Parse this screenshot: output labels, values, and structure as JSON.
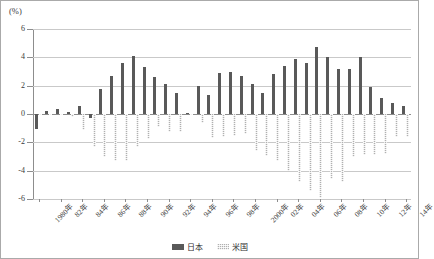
{
  "chart_data": {
    "type": "bar",
    "title": "",
    "subtitle": "",
    "unit_label": "(%)",
    "xlabel": "",
    "ylabel": "",
    "ylim": [
      -6,
      6
    ],
    "yticks": [
      6,
      4,
      2,
      0,
      -2,
      -4,
      -6
    ],
    "ytick_labels": [
      "6",
      "4",
      "2",
      "0",
      "-2",
      "-4",
      "-6"
    ],
    "grid": true,
    "legend_position": "bottom-center",
    "orientation": "vertical",
    "categories": [
      "1980年",
      "81年",
      "82年",
      "83年",
      "84年",
      "85年",
      "86年",
      "87年",
      "88年",
      "89年",
      "90年",
      "91年",
      "92年",
      "93年",
      "94年",
      "95年",
      "96年",
      "97年",
      "98年",
      "99年",
      "2000年",
      "01年",
      "02年",
      "03年",
      "04年",
      "05年",
      "06年",
      "07年",
      "08年",
      "09年",
      "10年",
      "11年",
      "12年",
      "13年",
      "14年"
    ],
    "tick_labels_shown": [
      "1980年",
      "82年",
      "84年",
      "86年",
      "88年",
      "90年",
      "92年",
      "94年",
      "96年",
      "98年",
      "2000年",
      "02年",
      "04年",
      "06年",
      "08年",
      "10年",
      "12年",
      "14年"
    ],
    "series": [
      {
        "name": "日本",
        "color": "#595959",
        "values": [
          -1.05,
          0.2,
          0.35,
          0.15,
          0.6,
          -0.25,
          1.75,
          2.7,
          3.6,
          4.1,
          3.35,
          2.6,
          2.1,
          1.45,
          0.05,
          1.95,
          1.35,
          2.9,
          3.0,
          2.7,
          2.1,
          1.45,
          2.85,
          3.4,
          3.85,
          3.6,
          4.7,
          4.0,
          3.2,
          3.2,
          4.05,
          1.9,
          1.15,
          0.75,
          0.6
        ]
      },
      {
        "name": "米国",
        "color": "#b0b0b0",
        "values": [
          -0.05,
          -0.05,
          -0.05,
          -0.2,
          -1.1,
          -2.35,
          -3.0,
          -3.3,
          -3.3,
          -2.35,
          -1.75,
          -0.9,
          -1.3,
          -1.3,
          -0.05,
          -0.65,
          -1.7,
          -1.6,
          -1.55,
          -1.4,
          -2.6,
          -2.95,
          -3.35,
          -4.0,
          -4.8,
          -5.4,
          -5.9,
          -4.6,
          -4.8,
          -3.0,
          -2.9,
          -2.9,
          -2.85,
          -1.6,
          -1.6
        ]
      }
    ]
  },
  "legend": {
    "items": [
      {
        "label": "日本"
      },
      {
        "label": "米国"
      }
    ]
  }
}
